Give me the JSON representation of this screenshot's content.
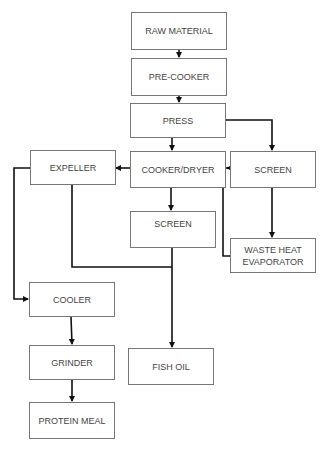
{
  "diagram": {
    "type": "process-flowchart",
    "nodes": {
      "raw_material": "RAW MATERIAL",
      "pre_cooker": "PRE-COOKER",
      "press": "PRESS",
      "cooker_dryer": "COOKER/DRYER",
      "screen_right": "SCREEN",
      "expeller": "EXPELLER",
      "screen_middle": "SCREEN",
      "waste_heat_line1": "WASTE HEAT",
      "waste_heat_line2": "EVAPORATOR",
      "cooler": "COOLER",
      "grinder": "GRINDER",
      "fish_oil": "FISH OIL",
      "protein_meal": "PROTEIN MEAL"
    },
    "edges": [
      [
        "RAW MATERIAL",
        "PRE-COOKER"
      ],
      [
        "PRE-COOKER",
        "PRESS"
      ],
      [
        "PRESS",
        "COOKER/DRYER"
      ],
      [
        "PRESS",
        "SCREEN (right)"
      ],
      [
        "SCREEN (right)",
        "COOKER/DRYER"
      ],
      [
        "SCREEN (right)",
        "WASTE HEAT EVAPORATOR"
      ],
      [
        "WASTE HEAT EVAPORATOR",
        "COOKER/DRYER"
      ],
      [
        "COOKER/DRYER",
        "EXPELLER"
      ],
      [
        "COOKER/DRYER",
        "SCREEN (middle)"
      ],
      [
        "EXPELLER",
        "COOLER"
      ],
      [
        "EXPELLER",
        "FISH OIL"
      ],
      [
        "SCREEN (middle)",
        "FISH OIL"
      ],
      [
        "COOLER",
        "GRINDER"
      ],
      [
        "GRINDER",
        "PROTEIN MEAL"
      ]
    ],
    "colors": {
      "line": "#111111",
      "border": "#777777",
      "text": "#444444"
    }
  }
}
